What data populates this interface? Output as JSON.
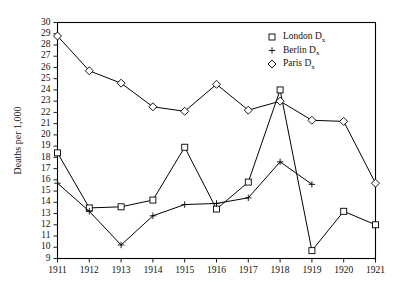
{
  "chart_data": {
    "type": "line",
    "title": "",
    "xlabel": "",
    "ylabel": "Deaths per 1,000",
    "x": [
      1911,
      1912,
      1913,
      1914,
      1915,
      1916,
      1917,
      1918,
      1919,
      1920,
      1921
    ],
    "xticklabels": [
      "1911",
      "1912",
      "1913",
      "1914",
      "1915",
      "1916",
      "1917",
      "1918",
      "1919",
      "1920",
      "1921"
    ],
    "yticklabels": [
      "9",
      "10",
      "11",
      "12",
      "13",
      "14",
      "15",
      "16",
      "17",
      "18",
      "19",
      "20",
      "21",
      "22",
      "23",
      "24",
      "25",
      "26",
      "27",
      "28",
      "29",
      "30"
    ],
    "ylim": [
      9,
      30
    ],
    "ytick_step": 1,
    "grid": false,
    "legend_position": "top-right",
    "series": [
      {
        "name": "London Dx",
        "label_main": "London D",
        "label_sub": "x",
        "marker": "square",
        "color": "#000000",
        "x": [
          1911,
          1912,
          1913,
          1914,
          1915,
          1916,
          1917,
          1918,
          1919,
          1920,
          1921
        ],
        "values": [
          18.4,
          13.5,
          13.6,
          14.2,
          18.9,
          13.4,
          15.8,
          24.0,
          9.7,
          13.2,
          12.0
        ]
      },
      {
        "name": "Berlin Dx",
        "label_main": "Berlin D",
        "label_sub": "x",
        "marker": "plus",
        "color": "#000000",
        "x": [
          1911,
          1912,
          1913,
          1914,
          1915,
          1916,
          1917,
          1918,
          1919
        ],
        "values": [
          15.7,
          13.2,
          10.2,
          12.8,
          13.8,
          13.9,
          14.4,
          17.6,
          15.6
        ]
      },
      {
        "name": "Paris Dx",
        "label_main": "Paris D",
        "label_sub": "x",
        "marker": "diamond",
        "color": "#000000",
        "x": [
          1911,
          1912,
          1913,
          1914,
          1915,
          1916,
          1917,
          1918,
          1919,
          1920,
          1921
        ],
        "values": [
          28.8,
          25.7,
          24.6,
          22.5,
          22.1,
          24.5,
          22.2,
          23.0,
          21.3,
          21.2,
          15.7
        ]
      }
    ]
  }
}
